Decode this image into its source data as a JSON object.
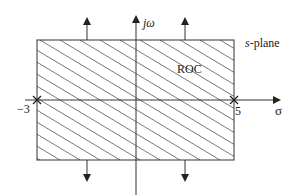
{
  "diagram": {
    "type": "s-plane region of convergence",
    "labels": {
      "imag_axis": "jω",
      "real_axis": "σ",
      "plane": "s-plane",
      "plane_italic": "s",
      "plane_rest": "-plane",
      "region": "ROC"
    },
    "markers": [
      {
        "label": "−3",
        "value": -3,
        "symbol": "×"
      },
      {
        "label": "5",
        "value": 5,
        "symbol": "×"
      }
    ],
    "roc": {
      "sigma_min": -3,
      "sigma_max": 5,
      "hatched": true,
      "extends_vertically": true
    },
    "colors": {
      "line": "#333333",
      "hatch": "#555555",
      "background": "#ffffff"
    }
  }
}
